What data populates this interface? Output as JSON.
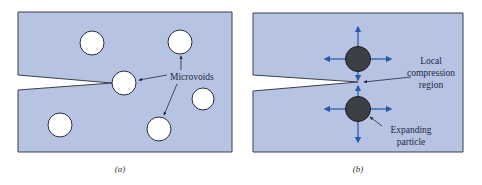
{
  "colors": {
    "panel_fill": "#b7c3e3",
    "panel_stroke": "#3a3f4d",
    "void_fill": "#ffffff",
    "particle_fill": "#3d3f47",
    "arrow_blue": "#2c5aa8",
    "leader_line": "#1e2a44"
  },
  "panel_a": {
    "caption": "(a)",
    "label_microvoids": "Microvoids",
    "voids": [
      {
        "cx": 92,
        "cy": 43,
        "r": 12
      },
      {
        "cx": 180,
        "cy": 42,
        "r": 12
      },
      {
        "cx": 124,
        "cy": 83,
        "r": 12
      },
      {
        "cx": 203,
        "cy": 99,
        "r": 12
      },
      {
        "cx": 60,
        "cy": 125,
        "r": 12
      },
      {
        "cx": 159,
        "cy": 129,
        "r": 12
      }
    ]
  },
  "panel_b": {
    "caption": "(b)",
    "label_compression_1": "Local",
    "label_compression_2": "compression",
    "label_compression_3": "region",
    "label_particle_1": "Expanding",
    "label_particle_2": "particle"
  }
}
